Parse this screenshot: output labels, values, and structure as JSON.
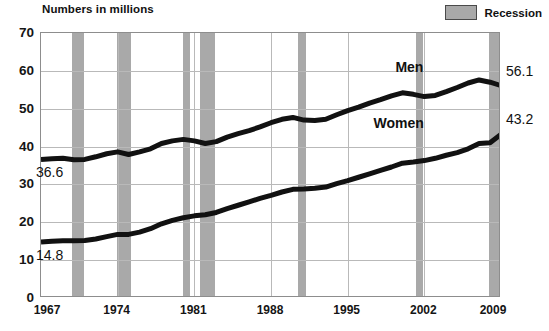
{
  "header": {
    "title": "Numbers in millions",
    "legend": {
      "label": "Recession",
      "swatch_color": "#a9a9a9"
    }
  },
  "annotations": {
    "men_start_value": "36.6",
    "women_start_value": "14.8",
    "men_end_value": "56.1",
    "women_end_value": "43.2",
    "men_series_label": "Men",
    "women_series_label": "Women"
  },
  "chart_data": {
    "type": "line",
    "title": "Numbers in millions",
    "xlabel": "",
    "ylabel": "Numbers in millions",
    "xlim": [
      1967,
      2009
    ],
    "ylim": [
      0,
      70
    ],
    "ytick_labels": [
      "0",
      "10",
      "20",
      "30",
      "40",
      "50",
      "60",
      "70"
    ],
    "yticks": [
      0,
      10,
      20,
      30,
      40,
      50,
      60,
      70
    ],
    "xtick_labels": [
      "1967",
      "1974",
      "1981",
      "1988",
      "1995",
      "2002",
      "2009"
    ],
    "xticks": [
      1967,
      1974,
      1981,
      1988,
      1995,
      2002,
      2009
    ],
    "grid": true,
    "legend_position": "top-right",
    "line_color": "#111111",
    "band_color": "#a9a9a9",
    "x": [
      1967,
      1968,
      1969,
      1970,
      1971,
      1972,
      1973,
      1974,
      1975,
      1976,
      1977,
      1978,
      1979,
      1980,
      1981,
      1982,
      1983,
      1984,
      1985,
      1986,
      1987,
      1988,
      1989,
      1990,
      1991,
      1992,
      1993,
      1994,
      1995,
      1996,
      1997,
      1998,
      1999,
      2000,
      2001,
      2002,
      2003,
      2004,
      2005,
      2006,
      2007,
      2008,
      2009
    ],
    "series": [
      {
        "name": "Men",
        "values": [
          36.6,
          36.8,
          36.9,
          36.5,
          36.6,
          37.3,
          38.1,
          38.6,
          37.9,
          38.6,
          39.4,
          40.8,
          41.5,
          41.9,
          41.5,
          40.8,
          41.3,
          42.5,
          43.4,
          44.2,
          45.2,
          46.3,
          47.2,
          47.7,
          47.0,
          46.9,
          47.2,
          48.4,
          49.5,
          50.4,
          51.5,
          52.4,
          53.4,
          54.2,
          53.8,
          53.2,
          53.5,
          54.5,
          55.6,
          56.8,
          57.6,
          57.0,
          56.1
        ],
        "label": "Men",
        "end_label": "56.1",
        "start_label": "36.6"
      },
      {
        "name": "Women",
        "values": [
          14.8,
          15.0,
          15.1,
          15.1,
          15.2,
          15.6,
          16.2,
          16.8,
          16.8,
          17.4,
          18.3,
          19.6,
          20.5,
          21.2,
          21.7,
          22.0,
          22.6,
          23.6,
          24.5,
          25.4,
          26.3,
          27.1,
          28.0,
          28.7,
          28.8,
          29.0,
          29.3,
          30.2,
          31.0,
          31.9,
          32.8,
          33.7,
          34.6,
          35.6,
          35.9,
          36.3,
          36.9,
          37.7,
          38.4,
          39.4,
          40.8,
          41.0,
          43.2
        ],
        "label": "Women",
        "end_label": "43.2",
        "start_label": "14.8"
      }
    ],
    "recession_bands": [
      {
        "start": 1969.8,
        "end": 1970.9
      },
      {
        "start": 1973.9,
        "end": 1975.2
      },
      {
        "start": 1980.0,
        "end": 1980.6
      },
      {
        "start": 1981.5,
        "end": 1982.9
      },
      {
        "start": 1990.5,
        "end": 1991.2
      },
      {
        "start": 2001.2,
        "end": 2001.9
      },
      {
        "start": 2007.9,
        "end": 2009.4
      }
    ]
  }
}
